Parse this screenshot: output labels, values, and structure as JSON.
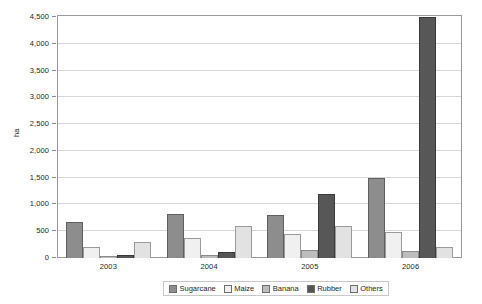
{
  "chart_data": {
    "type": "bar",
    "title": "",
    "xlabel": "",
    "ylabel": "ha",
    "ylim": [
      0,
      4500
    ],
    "ytick_step": 500,
    "grid": true,
    "legend_position": "bottom",
    "categories": [
      "2003",
      "2004",
      "2005",
      "2006"
    ],
    "ytick_labels": [
      "0",
      "500",
      "1,000",
      "1,500",
      "2,000",
      "2,500",
      "3,000",
      "3,500",
      "4,000",
      "4,500"
    ],
    "series": [
      {
        "name": "Sugarcane",
        "color": "#8d8d8d",
        "values": [
          680,
          820,
          800,
          1500
        ]
      },
      {
        "name": "Maize",
        "color": "#f0f0f0",
        "values": [
          200,
          380,
          440,
          480
        ]
      },
      {
        "name": "Banana",
        "color": "#bdbdbd",
        "values": [
          40,
          55,
          150,
          130
        ]
      },
      {
        "name": "Rubber",
        "color": "#575757",
        "values": [
          60,
          110,
          1200,
          4500
        ]
      },
      {
        "name": "Others",
        "color": "#e2e2e2",
        "values": [
          290,
          600,
          600,
          200
        ]
      }
    ]
  }
}
